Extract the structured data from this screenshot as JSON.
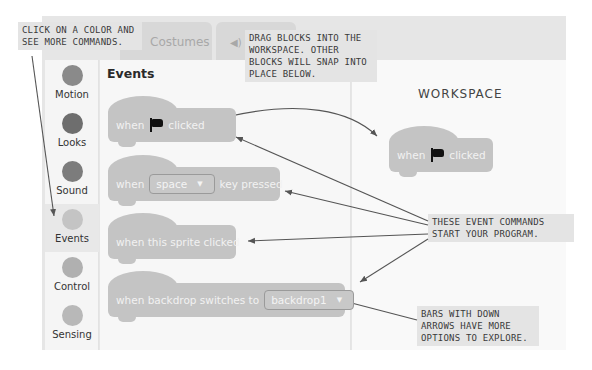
{
  "tabs": [
    {
      "label": "Costumes"
    },
    {
      "label": "Sounds",
      "icon": "speaker-icon"
    }
  ],
  "sidebar": {
    "items": [
      {
        "label": "Motion",
        "color": "#8a8a8a"
      },
      {
        "label": "Looks",
        "color": "#6e6e6e"
      },
      {
        "label": "Sound",
        "color": "#7c7c7c"
      },
      {
        "label": "Events",
        "color": "#c4c4c4",
        "selected": true
      },
      {
        "label": "Control",
        "color": "#b0b0b0"
      },
      {
        "label": "Sensing",
        "color": "#b8b8b8"
      }
    ]
  },
  "palette": {
    "title": "Events",
    "blocks": [
      {
        "parts": [
          "when",
          "flag-icon",
          "clicked"
        ]
      },
      {
        "before": "when",
        "dropdown": "space",
        "after": "key pressed"
      },
      {
        "text": "when this sprite clicked"
      },
      {
        "before": "when backdrop switches to",
        "dropdown": "backdrop1"
      }
    ]
  },
  "workspace": {
    "title": "WORKSPACE",
    "block": {
      "before": "when",
      "icon": "flag-icon",
      "after": "clicked"
    }
  },
  "callouts": {
    "category": [
      "CLICK ON A COLOR AND",
      "SEE MORE COMMANDS."
    ],
    "drag": [
      "DRAG BLOCKS INTO THE",
      "WORKSPACE. OTHER",
      "BLOCKS WILL SNAP INTO",
      "PLACE BELOW."
    ],
    "events": [
      "THESE EVENT COMMANDS",
      "START YOUR PROGRAM."
    ],
    "dropdowns": [
      "BARS WITH DOWN",
      "ARROWS HAVE MORE",
      "OPTIONS TO EXPLORE."
    ]
  }
}
